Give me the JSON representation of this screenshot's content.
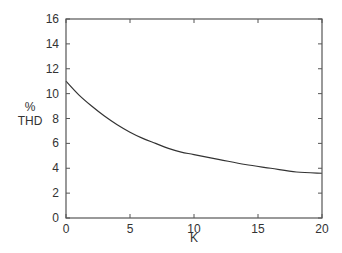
{
  "chart_data": {
    "type": "line",
    "title": "",
    "xlabel": "K",
    "ylabel": [
      "%",
      "THD"
    ],
    "xlim": [
      0,
      20
    ],
    "ylim": [
      0,
      16
    ],
    "xticks": [
      0,
      5,
      10,
      15,
      20
    ],
    "yticks": [
      0,
      2,
      4,
      6,
      8,
      10,
      12,
      14,
      16
    ],
    "grid": false,
    "legend": null,
    "series": [
      {
        "name": "%THD",
        "x": [
          0,
          1,
          2,
          3,
          4,
          5,
          6,
          7,
          8,
          9,
          10,
          12,
          14,
          16,
          18,
          20
        ],
        "values": [
          11.0,
          9.9,
          9.0,
          8.2,
          7.5,
          6.9,
          6.4,
          6.0,
          5.6,
          5.3,
          5.1,
          4.7,
          4.3,
          4.0,
          3.7,
          3.6
        ]
      }
    ],
    "colors": {
      "axis": "#555555",
      "line": "#333333",
      "text": "#333333"
    }
  }
}
